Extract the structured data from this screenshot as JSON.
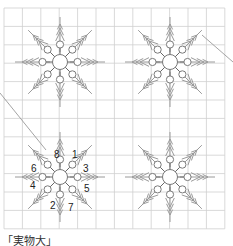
{
  "diagram": {
    "type": "embroidery-pattern",
    "caption": "「実物大」",
    "grid": {
      "x0": 4,
      "y0": 8,
      "cols": 12,
      "rows": 12,
      "cell": 18.4,
      "color": "#cfcfcf"
    },
    "colors": {
      "arm": "#9a9a9a",
      "circle_stroke": "#7a7a7a",
      "numbers": "#222222",
      "diagonal": "#9a9a9a"
    },
    "snowflakes": [
      {
        "name": "snowflake-top-left",
        "cx": 60,
        "cy": 62
      },
      {
        "name": "snowflake-top-right",
        "cx": 170,
        "cy": 62
      },
      {
        "name": "snowflake-bottom-left",
        "cx": 60,
        "cy": 177,
        "numbered": true
      },
      {
        "name": "snowflake-bottom-right",
        "cx": 170,
        "cy": 177
      }
    ],
    "order_labels": [
      {
        "label": "1",
        "dx": 12,
        "dy": -23
      },
      {
        "label": "8",
        "dx": -6,
        "dy": -23
      },
      {
        "label": "3",
        "dx": 23,
        "dy": -9
      },
      {
        "label": "6",
        "dx": -29,
        "dy": -9
      },
      {
        "label": "5",
        "dx": 24,
        "dy": 11
      },
      {
        "label": "4",
        "dx": -30,
        "dy": 8
      },
      {
        "label": "2",
        "dx": -10,
        "dy": 28
      },
      {
        "label": "7",
        "dx": 8,
        "dy": 30
      }
    ],
    "diagonals": [
      {
        "x1": 0,
        "y1": 93,
        "x2": 46,
        "y2": 150
      },
      {
        "x1": 202,
        "y1": 35,
        "x2": 233,
        "y2": 62
      }
    ]
  }
}
